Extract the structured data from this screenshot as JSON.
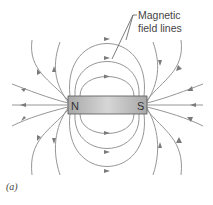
{
  "figure": {
    "caption": "(a)",
    "annotation": {
      "line1": "Magnetic",
      "line2": "field lines"
    },
    "magnet": {
      "north_label": "N",
      "south_label": "S",
      "color_light": "#d4d4d4",
      "color_dark": "#a6a6a6",
      "border": "#555555"
    },
    "colors": {
      "field_line": "#8a8a8a",
      "arrow": "#7a7a7a",
      "background": "#ffffff"
    }
  }
}
